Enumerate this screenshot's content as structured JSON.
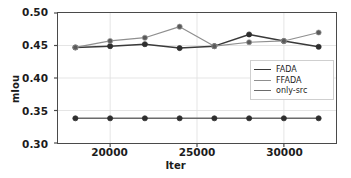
{
  "chart_data": {
    "type": "line",
    "title": "",
    "xlabel": "Iter",
    "ylabel": "mIou",
    "x": [
      18000,
      20000,
      22000,
      24000,
      26000,
      28000,
      30000,
      32000
    ],
    "xlim": [
      17000,
      33000
    ],
    "ylim": [
      0.3,
      0.5
    ],
    "xticks": [
      20000,
      25000,
      30000
    ],
    "xticklabels": [
      "20000",
      "25000",
      "30000"
    ],
    "yticks": [
      0.3,
      0.35,
      0.4,
      0.45,
      0.5
    ],
    "yticklabels": [
      "0.30",
      "0.35",
      "0.40",
      "0.45",
      "0.50"
    ],
    "grid": true,
    "legend_position": "center right",
    "series": [
      {
        "name": "FADA",
        "color": "#3a3a3a",
        "values": [
          0.447,
          0.449,
          0.452,
          0.446,
          0.449,
          0.467,
          0.457,
          0.448
        ]
      },
      {
        "name": "FFADA",
        "color": "#8f8f8f",
        "values": [
          0.447,
          0.457,
          0.462,
          0.479,
          0.449,
          0.455,
          0.457,
          0.47
        ]
      },
      {
        "name": "only-src",
        "color": "#6b6b6b",
        "values": [
          0.338,
          0.338,
          0.338,
          0.338,
          0.338,
          0.338,
          0.338,
          0.338
        ]
      }
    ]
  },
  "legend": {
    "entries": [
      {
        "label": "FADA"
      },
      {
        "label": "FFADA"
      },
      {
        "label": "only-src"
      }
    ]
  },
  "colors": {
    "axis": "#4a4a4a",
    "grid": "#e2e2e2",
    "text": "#1c1c1c",
    "background": "#ffffff"
  }
}
